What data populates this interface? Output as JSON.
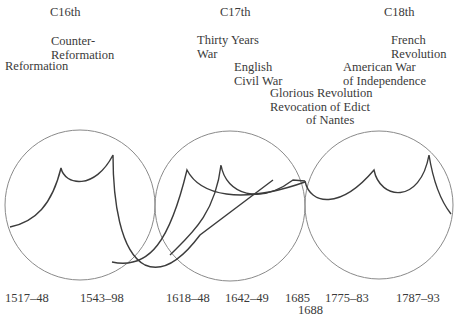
{
  "centuries": [
    {
      "label": "C16th"
    },
    {
      "label": "C17th"
    },
    {
      "label": "C18th"
    }
  ],
  "events": {
    "counter_reformation": "Counter-\nReformation",
    "reformation": "Reformation",
    "thirty_years_war": "Thirty Years\nWar",
    "english_civil_war": "English\nCivil War",
    "glorious_revolution": "Glorious Revolution",
    "revocation": "Revocation of Edict",
    "revocation_2": "of Nantes",
    "american_war": "American War\nof Independence",
    "french_revolution": "French\nRevolution"
  },
  "dates": [
    {
      "label": "1517–48"
    },
    {
      "label": "1543–98"
    },
    {
      "label": "1618–48"
    },
    {
      "label": "1642–49"
    },
    {
      "label": "1685"
    },
    {
      "label": "1688"
    },
    {
      "label": "1775–83"
    },
    {
      "label": "1787–93"
    }
  ],
  "colors": {
    "circle": "#8a8a8a",
    "curve": "#3c3c3c",
    "text": "#3a3a3a"
  }
}
